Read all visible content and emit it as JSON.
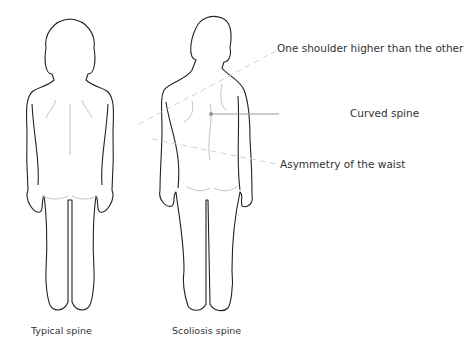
{
  "annotations": {
    "shoulder": "One shoulder higher than the other",
    "spine": "Curved spine",
    "waist": "Asymmetry of the waist"
  },
  "captions": {
    "typical": "Typical spine",
    "scoliosis": "Scoliosis spine"
  },
  "colors": {
    "outline": "#222222",
    "detail": "#bbbbbb",
    "guide": "#cccccc",
    "pointer": "#999999",
    "text": "#333333"
  }
}
